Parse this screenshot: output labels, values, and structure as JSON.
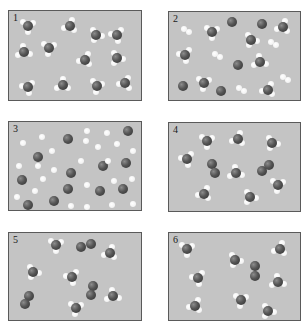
{
  "figure": {
    "colors": {
      "nitrogen": "#4a4a4a",
      "hydrogen": "#ffffff",
      "panel_bg": "#c4c4c4",
      "border": "#5a5a5a"
    },
    "panels": [
      {
        "label": "1",
        "box": [
          8,
          10,
          134,
          91
        ],
        "nh3": [
          [
            28,
            26
          ],
          [
            70,
            26
          ],
          [
            96,
            35
          ],
          [
            117,
            35
          ],
          [
            24,
            52
          ],
          [
            49,
            48
          ],
          [
            85,
            60
          ],
          [
            117,
            58
          ],
          [
            28,
            87
          ],
          [
            63,
            85
          ],
          [
            97,
            86
          ],
          [
            125,
            83
          ]
        ],
        "n2": [],
        "h2": [],
        "n": [],
        "h": []
      },
      {
        "label": "2",
        "box": [
          168,
          11,
          133,
          90
        ],
        "nh3": [
          [
            212,
            32
          ],
          [
            283,
            27
          ],
          [
            251,
            40
          ],
          [
            185,
            55
          ],
          [
            260,
            62
          ],
          [
            204,
            83
          ],
          [
            268,
            90
          ]
        ],
        "n2": [],
        "h2": [
          [
            186,
            30
          ],
          [
            217,
            55
          ],
          [
            273,
            43
          ],
          [
            285,
            78
          ],
          [
            241,
            89
          ]
        ],
        "n": [
          [
            232,
            22
          ],
          [
            262,
            24
          ],
          [
            238,
            65
          ],
          [
            183,
            86
          ],
          [
            221,
            91
          ]
        ],
        "h": []
      },
      {
        "label": "3",
        "box": [
          8,
          121,
          134,
          90
        ],
        "nh3": [],
        "n2": [],
        "h2": [],
        "n": [
          [
            128,
            131
          ],
          [
            68,
            139
          ],
          [
            38,
            157
          ],
          [
            103,
            166
          ],
          [
            126,
            163
          ],
          [
            71,
            173
          ],
          [
            22,
            180
          ],
          [
            68,
            189
          ],
          [
            100,
            191
          ],
          [
            123,
            189
          ],
          [
            28,
            205
          ],
          [
            54,
            201
          ]
        ],
        "h": [
          [
            87,
            131
          ],
          [
            107,
            133
          ],
          [
            42,
            137
          ],
          [
            23,
            143
          ],
          [
            86,
            141
          ],
          [
            117,
            144
          ],
          [
            98,
            147
          ],
          [
            52,
            151
          ],
          [
            133,
            151
          ],
          [
            81,
            161
          ],
          [
            19,
            166
          ],
          [
            38,
            166
          ],
          [
            54,
            170
          ],
          [
            108,
            161
          ],
          [
            132,
            179
          ],
          [
            114,
            181
          ],
          [
            43,
            179
          ],
          [
            87,
            185
          ],
          [
            35,
            191
          ],
          [
            17,
            197
          ],
          [
            71,
            206
          ],
          [
            87,
            207
          ],
          [
            112,
            205
          ],
          [
            133,
            204
          ]
        ]
      },
      {
        "label": "4",
        "box": [
          168,
          122,
          133,
          90
        ],
        "nh3": [
          [
            207,
            141
          ],
          [
            238,
            139
          ],
          [
            272,
            143
          ],
          [
            187,
            159
          ],
          [
            236,
            173
          ],
          [
            278,
            185
          ],
          [
            204,
            194
          ],
          [
            250,
            197
          ]
        ],
        "n2": [
          [
            [
              212,
              164
            ],
            [
              215,
              173
            ]
          ],
          [
            [
              262,
              171
            ],
            [
              269,
              165
            ]
          ]
        ],
        "h2": [],
        "n": [],
        "h": []
      },
      {
        "label": "5",
        "box": [
          8,
          232,
          134,
          89
        ],
        "nh3": [
          [
            56,
            245
          ],
          [
            110,
            253
          ],
          [
            33,
            272
          ],
          [
            72,
            277
          ],
          [
            113,
            296
          ],
          [
            76,
            308
          ]
        ],
        "n2": [
          [
            [
              81,
              247
            ],
            [
              91,
              244
            ]
          ],
          [
            [
              93,
              286
            ],
            [
              91,
              295
            ]
          ],
          [
            [
              29,
              296
            ],
            [
              25,
              304
            ]
          ]
        ],
        "h2": [],
        "n": [],
        "h": []
      },
      {
        "label": "6",
        "box": [
          168,
          232,
          133,
          89
        ],
        "nh3": [
          [
            187,
            249
          ],
          [
            280,
            249
          ],
          [
            235,
            260
          ],
          [
            198,
            278
          ],
          [
            278,
            282
          ],
          [
            241,
            300
          ],
          [
            195,
            306
          ],
          [
            268,
            311
          ]
        ],
        "n2": [
          [
            [
              255,
              266
            ],
            [
              255,
              276
            ]
          ]
        ],
        "h2": [],
        "n": [],
        "h": []
      }
    ]
  }
}
